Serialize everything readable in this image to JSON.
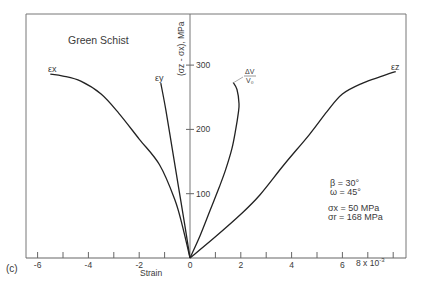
{
  "chart_data": {
    "type": "line",
    "panel_label": "(c)",
    "title": "Green Schist",
    "xlabel": "Strain",
    "x_multiplier_label": "8 x 10",
    "x_multiplier_exp": "-3",
    "ylabel": "(σz - σx), MPa",
    "xlim": [
      -6.5,
      8.5
    ],
    "ylim": [
      0,
      380
    ],
    "x_ticks": [
      -6,
      -5,
      -4,
      -3,
      -2,
      -1,
      0,
      1,
      2,
      3,
      4,
      5,
      6,
      7,
      8
    ],
    "x_tick_labels": [
      {
        "value": -6,
        "label": "-6"
      },
      {
        "value": -4,
        "label": "-4"
      },
      {
        "value": -2,
        "label": "-2"
      },
      {
        "value": 0,
        "label": "0"
      },
      {
        "value": 2,
        "label": "2"
      },
      {
        "value": 4,
        "label": "4"
      },
      {
        "value": 6,
        "label": "6"
      }
    ],
    "y_tick_labels": [
      {
        "value": 100,
        "label": "100"
      },
      {
        "value": 200,
        "label": "200"
      },
      {
        "value": 300,
        "label": "300"
      }
    ],
    "grid": false,
    "series": [
      {
        "name": "εx",
        "label_main": "ε",
        "label_sub": "x",
        "x": [
          0,
          -0.3,
          -0.6,
          -1.2,
          -2.0,
          -2.8,
          -3.5,
          -4.3,
          -5.0,
          -5.5
        ],
        "y": [
          0,
          50,
          91,
          145,
          185,
          225,
          255,
          275,
          283,
          286
        ]
      },
      {
        "name": "εy",
        "label_main": "ε",
        "label_sub": "y",
        "x": [
          0,
          -0.2,
          -0.45,
          -0.7,
          -0.95,
          -1.15
        ],
        "y": [
          0,
          50,
          110,
          170,
          230,
          272
        ]
      },
      {
        "name": "ΔV/V0",
        "label_main": "ΔV",
        "label_sub": "V₀",
        "x": [
          0,
          0.4,
          0.8,
          1.15,
          1.4,
          1.65,
          1.8,
          1.9,
          1.93,
          1.85,
          1.7
        ],
        "y": [
          0,
          35,
          75,
          110,
          137,
          170,
          200,
          225,
          240,
          262,
          273
        ]
      },
      {
        "name": "εz",
        "label_main": "ε",
        "label_sub": "z",
        "x": [
          0,
          1.0,
          2.0,
          2.75,
          3.7,
          4.7,
          5.4,
          6.0,
          6.8,
          7.5,
          8.1
        ],
        "y": [
          0,
          33,
          68,
          98,
          145,
          192,
          228,
          255,
          272,
          282,
          290
        ]
      }
    ],
    "annotations": [
      {
        "text": "β = 30°"
      },
      {
        "text": "ω = 45°"
      },
      {
        "text": "σx = 50 MPa"
      },
      {
        "text": "σr = 168 MPa"
      }
    ]
  },
  "labels": {
    "title": "Green Schist",
    "panel": "(c)",
    "xlabel": "Strain",
    "ylabel": "(σz - σx), MPa",
    "beta": "β = 30°",
    "omega": "ω = 45°",
    "sx": "σx = 50 MPa",
    "sr": "σr = 168 MPa",
    "mult": "8 x 10",
    "mult_exp": "-3",
    "ex": "εx",
    "ey": "εy",
    "ez": "εz",
    "dv_num": "ΔV",
    "dv_den": "V₀"
  },
  "style": {
    "line_color": "#222222",
    "axis_color": "#555555",
    "text_color": "#3a3a3a"
  }
}
